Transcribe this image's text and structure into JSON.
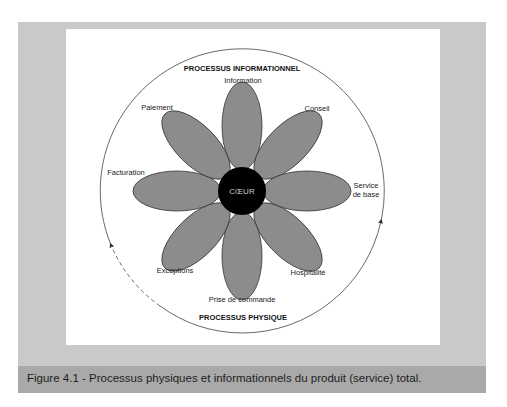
{
  "figure": {
    "caption": "Figure 4.1 - Processus physiques et informationnels du produit (service) total.",
    "top_arc_label": "PROCESSUS INFORMATIONNEL",
    "bottom_arc_label": "PROCESSUS PHYSIQUE",
    "core_label": "CŒUR",
    "petals": [
      {
        "label": "Information",
        "angle": -90
      },
      {
        "label": "Conseil",
        "angle": -45
      },
      {
        "label_line1": "Service",
        "label_line2": "de base",
        "angle": 0
      },
      {
        "label": "Hospitalité",
        "angle": 45
      },
      {
        "label": "Prise de commande",
        "angle": 90
      },
      {
        "label": "Exceptions",
        "angle": 135
      },
      {
        "label": "Facturation",
        "angle": 180
      },
      {
        "label": "Paiement",
        "angle": -135
      }
    ],
    "colors": {
      "frame": "#c9c9c9",
      "caption_band": "#a9a9a9",
      "petal_fill": "#8c8c8c",
      "core_fill": "#000000"
    }
  }
}
